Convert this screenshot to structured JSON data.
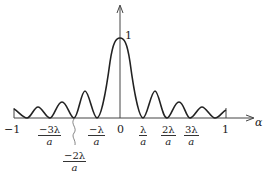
{
  "diagram": {
    "type": "single-slit diffraction intensity pattern",
    "y_axis": {
      "peak_label": "1"
    },
    "x_axis": {
      "label": "α",
      "left_end_label": "−1",
      "right_end_label": "1",
      "origin_label": "0"
    },
    "tick_labels": [
      {
        "id": "neg3",
        "num": "−3λ",
        "den": "a"
      },
      {
        "id": "neg2",
        "num": "−2λ",
        "den": "a"
      },
      {
        "id": "neg1",
        "num": "−λ",
        "den": "a"
      },
      {
        "id": "pos1",
        "num": "λ",
        "den": "a"
      },
      {
        "id": "pos2",
        "num": "2λ",
        "den": "a"
      },
      {
        "id": "pos3",
        "num": "3λ",
        "den": "a"
      }
    ],
    "colors": {
      "curve": "#222222",
      "axis": "#444444",
      "background": "#ffffff"
    }
  }
}
